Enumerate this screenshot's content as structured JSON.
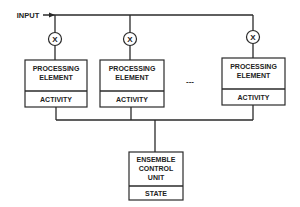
{
  "diagram": {
    "input_label": "INPUT",
    "multiplier_symbol": "X",
    "ellipsis": "---",
    "processing_elements": [
      {
        "title_line1": "PROCESSING",
        "title_line2": "ELEMENT",
        "sub": "ACTIVITY"
      },
      {
        "title_line1": "PROCESSING",
        "title_line2": "ELEMENT",
        "sub": "ACTIVITY"
      },
      {
        "title_line1": "PROCESSING",
        "title_line2": "ELEMENT",
        "sub": "ACTIVITY"
      }
    ],
    "control_unit": {
      "title_line1": "ENSEMBLE",
      "title_line2": "CONTROL",
      "title_line3": "UNIT",
      "sub": "STATE"
    }
  }
}
